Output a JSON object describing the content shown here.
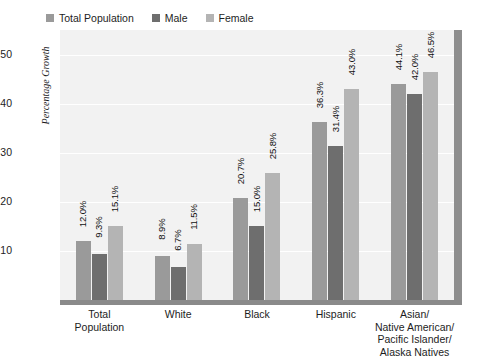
{
  "chart_data": {
    "type": "bar",
    "title": "",
    "subtitle": "",
    "xlabel": "",
    "ylabel": "Percentage Growth",
    "ylim": [
      0,
      55
    ],
    "yticks": [
      10,
      20,
      30,
      40,
      50
    ],
    "ytick_labels": [
      "10",
      "20",
      "30",
      "40",
      "50"
    ],
    "grid": true,
    "legend_position": "top-left",
    "categories": [
      "Total\nPopulation",
      "White",
      "Black",
      "Hispanic",
      "Asian/\nNative American/\nPacific Islander/\nAlaska Natives"
    ],
    "series": [
      {
        "name": "Total Population",
        "color": "#9a9a9a",
        "values": [
          12.0,
          8.9,
          20.7,
          36.3,
          44.1
        ],
        "labels": [
          "12.0%",
          "8.9%",
          "20.7%",
          "36.3%",
          "44.1%"
        ]
      },
      {
        "name": "Male",
        "color": "#6e6e6e",
        "values": [
          9.3,
          6.7,
          15.0,
          31.4,
          42.0
        ],
        "labels": [
          "9.3%",
          "6.7%",
          "15.0%",
          "31.4%",
          "42.0%"
        ]
      },
      {
        "name": "Female",
        "color": "#b4b4b4",
        "values": [
          15.1,
          11.5,
          25.8,
          43.0,
          46.5
        ],
        "labels": [
          "15.1%",
          "11.5%",
          "25.8%",
          "43.0%",
          "46.5%"
        ]
      }
    ]
  },
  "legend": {
    "items": [
      {
        "label": "Total Population",
        "color": "#9a9a9a"
      },
      {
        "label": "Male",
        "color": "#6e6e6e"
      },
      {
        "label": "Female",
        "color": "#b4b4b4"
      }
    ]
  },
  "axis": {
    "y_title": "Percentage Growth",
    "y_ticks": [
      "50",
      "40",
      "30",
      "20",
      "10"
    ],
    "x_categories": [
      [
        "Total",
        "Population"
      ],
      [
        "White"
      ],
      [
        "Black"
      ],
      [
        "Hispanic"
      ],
      [
        "Asian/",
        "Native American/",
        "Pacific Islander/",
        "Alaska Natives"
      ]
    ]
  },
  "colors": {
    "plot_background": "#f2f2f2",
    "gridline": "#ffffff",
    "frame": "#8a8a8a",
    "page_background": "#ffffff",
    "text": "#1d1d1d"
  }
}
